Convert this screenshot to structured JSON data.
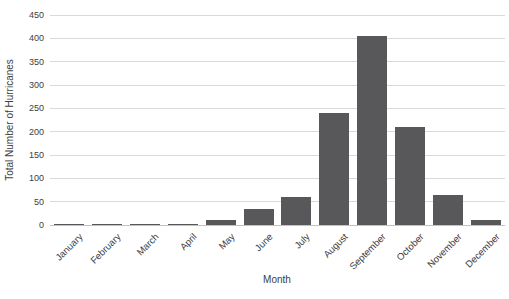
{
  "chart_data": {
    "type": "bar",
    "categories": [
      "January",
      "February",
      "March",
      "April",
      "May",
      "June",
      "July",
      "August",
      "September",
      "October",
      "November",
      "December"
    ],
    "values": [
      3,
      1,
      1,
      1,
      10,
      35,
      60,
      240,
      405,
      210,
      65,
      10
    ],
    "xlabel": "Month",
    "ylabel": "Total Number of Hurricanes",
    "ylim": [
      0,
      450
    ],
    "yticks": [
      0,
      50,
      100,
      150,
      200,
      250,
      300,
      350,
      400,
      450
    ],
    "grid": true,
    "legend": false,
    "x_label_rotation_deg": 45,
    "bar_color": "#58585a",
    "gridline_color": "#d9d9d9",
    "baseline_color": "#c2c2c2",
    "axis_text_color": "#404040",
    "background_color": "#ffffff"
  }
}
